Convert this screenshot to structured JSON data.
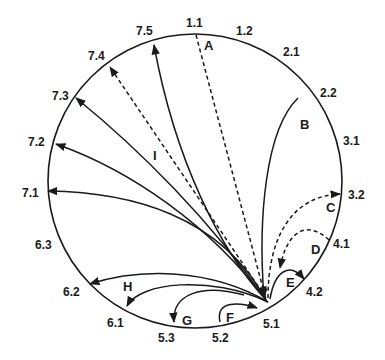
{
  "diagram": {
    "type": "circular-connectivity",
    "node_labels": {
      "n11": "1.1",
      "n12": "1.2",
      "n21": "2.1",
      "n22": "2.2",
      "n31": "3.1",
      "n32": "3.2",
      "n41": "4.1",
      "n42": "4.2",
      "n51": "5.1",
      "n52": "5.2",
      "n53": "5.3",
      "n61": "6.1",
      "n62": "6.2",
      "n63": "6.3",
      "n71": "7.1",
      "n72": "7.2",
      "n73": "7.3",
      "n74": "7.4",
      "n75": "7.5"
    },
    "connection_labels": {
      "A": "A",
      "B": "B",
      "C": "C",
      "D": "D",
      "E": "E",
      "F": "F",
      "G": "G",
      "H": "H",
      "I": "I"
    },
    "connections": [
      {
        "label": "A",
        "from": "1.1",
        "to": "5.1",
        "style": "dashed"
      },
      {
        "label": "B",
        "from": "2.2",
        "to": "5.1",
        "style": "solid"
      },
      {
        "label": "C",
        "from": "5.1",
        "to": "3.2",
        "style": "dashed"
      },
      {
        "label": "D",
        "from": "4.1",
        "to": "5.1",
        "style": "dashed"
      },
      {
        "label": "E",
        "from": "5.1",
        "to": "4.2",
        "style": "solid"
      },
      {
        "label": "F",
        "from": "5.2",
        "to": "5.1",
        "style": "solid"
      },
      {
        "label": "G",
        "from": "5.1",
        "to": "5.3",
        "style": "solid"
      },
      {
        "label": "H",
        "from": "5.1",
        "to": [
          "6.2",
          "6.1"
        ],
        "style": "solid"
      },
      {
        "label": "I",
        "from": "5.1",
        "to": [
          "7.1",
          "7.2",
          "7.3",
          "7.4",
          "7.5"
        ],
        "style": "solid/dashed(7.4)"
      }
    ]
  }
}
